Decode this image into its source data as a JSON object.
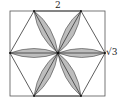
{
  "figure": {
    "labels": {
      "top_width": "2",
      "right_height": "√3"
    },
    "rectangle": {
      "x": 10,
      "y": 11,
      "width": 95,
      "height": 85
    },
    "hexagon_vertices": [
      [
        34,
        11
      ],
      [
        81,
        11
      ],
      [
        105,
        53
      ],
      [
        81,
        96
      ],
      [
        34,
        96
      ],
      [
        10,
        53
      ]
    ],
    "center": [
      58,
      53
    ],
    "petal_count": 6,
    "colors": {
      "petal_fill": "#bdbdbd",
      "stroke": "#333333",
      "background": "#ffffff"
    }
  }
}
